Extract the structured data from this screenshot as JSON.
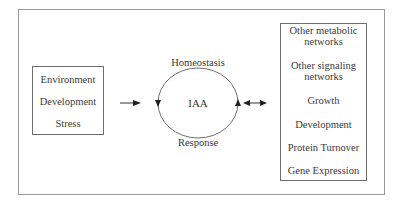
{
  "diagram": {
    "inputs_box": {
      "items": [
        "Environment",
        "Development",
        "Stress"
      ]
    },
    "cycle": {
      "center_label": "IAA",
      "top_label": "Homeostasis",
      "bottom_label": "Response"
    },
    "outputs_box": {
      "items": [
        "Other metabolic",
        "networks",
        "Other signaling",
        "networks",
        "Growth",
        "Development",
        "Protein Turnover",
        "Gene Expression"
      ]
    },
    "connectors": [
      {
        "from": "inputs_box",
        "to": "cycle",
        "type": "single-arrow"
      },
      {
        "from": "cycle",
        "to": "outputs_box",
        "type": "double-arrow"
      }
    ],
    "colors": {
      "line": "#6e6e6e",
      "frame": "#9a9a9a",
      "text": "#3a3a3a",
      "background": "#ffffff"
    }
  }
}
